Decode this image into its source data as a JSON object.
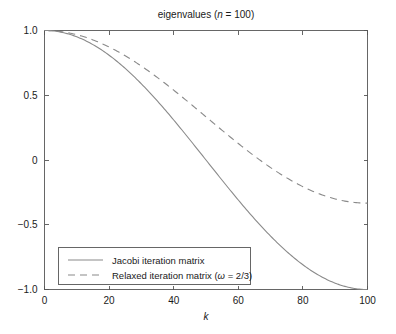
{
  "chart_data": {
    "type": "line",
    "title": "eigenvalues (n = 100)",
    "title_parts": {
      "prefix": "eigenvalues (",
      "italic_symbol": "n",
      "suffix": " = 100)"
    },
    "xlabel": "k",
    "ylabel": "",
    "xlim": [
      0,
      100
    ],
    "ylim": [
      -1.0,
      1.0
    ],
    "xticks": [
      0,
      20,
      40,
      60,
      80,
      100
    ],
    "xticklabels": [
      "0",
      "20",
      "40",
      "60",
      "80",
      "100"
    ],
    "yticks": [
      1.0,
      0.5,
      0,
      -0.5,
      -1.0
    ],
    "yticklabels": [
      "1.0",
      "0.5",
      "0",
      "−0.5",
      "−1.0"
    ],
    "grid": false,
    "legend_position": "lower left",
    "n": 100,
    "omega": "2/3",
    "series": [
      {
        "name": "Jacobi iteration matrix",
        "style": "solid",
        "color": "#8a8a8a",
        "formula": "cos(k*pi/n)",
        "x": [
          0,
          5,
          10,
          15,
          20,
          25,
          30,
          35,
          40,
          45,
          50,
          55,
          60,
          65,
          70,
          75,
          80,
          85,
          90,
          95,
          100
        ],
        "values": [
          1.0,
          0.9877,
          0.9511,
          0.891,
          0.809,
          0.7071,
          0.5878,
          0.454,
          0.309,
          0.1564,
          0.0,
          -0.1564,
          -0.309,
          -0.454,
          -0.5878,
          -0.7071,
          -0.809,
          -0.891,
          -0.9511,
          -0.9877,
          -1.0
        ]
      },
      {
        "name": "Relaxed iteration matrix (ω = 2/3)",
        "style": "dashed",
        "color": "#8a8a8a",
        "formula": "1 - (2/3)*(1 - cos(k*pi/n))",
        "x": [
          0,
          5,
          10,
          15,
          20,
          25,
          30,
          35,
          40,
          45,
          50,
          55,
          60,
          65,
          70,
          75,
          80,
          85,
          90,
          95,
          100
        ],
        "values": [
          1.0,
          0.9918,
          0.9674,
          0.9273,
          0.8727,
          0.8047,
          0.7252,
          0.636,
          0.5393,
          0.4376,
          0.3333,
          0.2291,
          0.1273,
          0.0307,
          -0.0585,
          -0.1381,
          -0.206,
          -0.2607,
          -0.3007,
          -0.3251,
          -0.3333
        ]
      }
    ],
    "legend": [
      {
        "label": "Jacobi iteration matrix",
        "style": "solid"
      },
      {
        "label_prefix": "Relaxed iteration matrix (",
        "label_symbol": "ω",
        "label_suffix": " = 2/3)",
        "style": "dashed"
      }
    ]
  }
}
